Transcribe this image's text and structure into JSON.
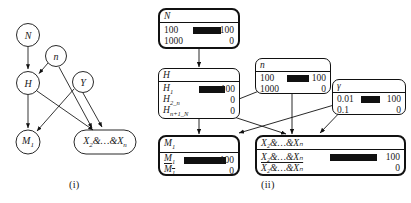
{
  "figure": {
    "panels": [
      {
        "id": "i",
        "caption": "(i)"
      },
      {
        "id": "ii",
        "caption": "(ii)"
      }
    ]
  },
  "panel_i": {
    "nodes": [
      {
        "name": "N",
        "label": "N",
        "shape": "ellipse"
      },
      {
        "name": "n",
        "label": "n",
        "shape": "ellipse"
      },
      {
        "name": "H",
        "label": "H",
        "shape": "ellipse"
      },
      {
        "name": "Y",
        "label": "Y",
        "shape": "ellipse"
      },
      {
        "name": "M1",
        "label": "M",
        "sub": "1",
        "shape": "ellipse"
      },
      {
        "name": "X2andXn",
        "label": "X",
        "sub": "2",
        "tail": "&…&X",
        "tail_sub": "n",
        "shape": "rounded-rect"
      }
    ],
    "edges": [
      {
        "from": "N",
        "to": "H"
      },
      {
        "from": "n",
        "to": "H"
      },
      {
        "from": "n",
        "to": "X2andXn"
      },
      {
        "from": "H",
        "to": "M1"
      },
      {
        "from": "H",
        "to": "X2andXn"
      },
      {
        "from": "Y",
        "to": "M1"
      },
      {
        "from": "Y",
        "to": "X2andXn"
      }
    ]
  },
  "panel_ii": {
    "boxes": [
      {
        "name": "node-N",
        "title": "N",
        "bold": true,
        "rows": [
          {
            "label": "100",
            "value": "100",
            "bar": 100
          },
          {
            "label": "1000",
            "value": "0",
            "bar": 0
          }
        ]
      },
      {
        "name": "node-H",
        "title": "H",
        "bold": false,
        "rows": [
          {
            "label": "H",
            "sub": "1",
            "value": "100",
            "bar": 100
          },
          {
            "label": "H",
            "sub": "2_n",
            "value": "0",
            "bar": 0
          },
          {
            "label": "H",
            "sub": "n+1_N",
            "value": "0",
            "bar": 0
          }
        ]
      },
      {
        "name": "node-n",
        "title": "n",
        "bold": false,
        "rows": [
          {
            "label": "100",
            "value": "100",
            "bar": 100
          },
          {
            "label": "1000",
            "value": "0",
            "bar": 0
          }
        ]
      },
      {
        "name": "node-gamma",
        "title": "γ",
        "bold": false,
        "rows": [
          {
            "label": "0.01",
            "value": "100",
            "bar": 100
          },
          {
            "label": "0.1",
            "value": "0",
            "bar": 0
          }
        ]
      },
      {
        "name": "node-M1",
        "title": "M₁",
        "bold": true,
        "rows": [
          {
            "label": "M",
            "sub": "1",
            "value": "100",
            "bar": 100,
            "negated": false
          },
          {
            "label": "M",
            "sub": "1",
            "value": "0",
            "bar": 0,
            "negated": true
          }
        ]
      },
      {
        "name": "node-X",
        "title": "X₂&…&Xₙ",
        "bold": true,
        "rows": [
          {
            "label": "X₂&…&Xₙ",
            "value": "100",
            "bar": 100,
            "negated": false
          },
          {
            "label": "X₂&…&Xₙ",
            "value": "0",
            "bar": 0,
            "negated": true
          }
        ]
      }
    ],
    "edges": [
      {
        "from": "node-N",
        "to": "node-H"
      },
      {
        "from": "node-H",
        "to": "node-M1"
      },
      {
        "from": "node-H",
        "to": "node-X"
      },
      {
        "from": "node-n",
        "to": "node-H"
      },
      {
        "from": "node-n",
        "to": "node-X"
      },
      {
        "from": "node-gamma",
        "to": "node-M1"
      },
      {
        "from": "node-gamma",
        "to": "node-X"
      }
    ]
  },
  "colors": {
    "stroke": "#111111",
    "bar": "#111111",
    "background": "#ffffff"
  }
}
